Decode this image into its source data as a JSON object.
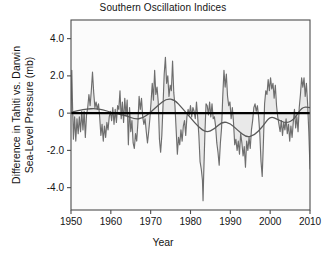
{
  "chart_data": {
    "type": "line",
    "title": "Southern Oscillation Indices",
    "xlabel": "Year",
    "ylabel": "Difference in Tahiti vs. Darwin Sea-Level Pressure (mb)",
    "ylabel_line1": "Difference in Tahiti vs. Darwin",
    "ylabel_line2": "Sea-Level Pressure (mb)",
    "xlim": [
      1950,
      2010
    ],
    "ylim": [
      -5.2,
      5.0
    ],
    "xticks": [
      1950,
      1960,
      1970,
      1980,
      1990,
      2000,
      2010
    ],
    "xtick_labels": [
      "1950",
      "1960",
      "1970",
      "1980",
      "1990",
      "2000",
      "2010"
    ],
    "yticks": [
      4,
      2,
      0,
      -2,
      -4
    ],
    "ytick_labels": [
      "4.0",
      "2.0",
      "0",
      "-2.0",
      "-4.0"
    ],
    "grid": false,
    "legend": "none",
    "reference_line": {
      "y": 0,
      "color": "#000000",
      "width": 2.2
    },
    "series": [
      {
        "name": "Southern Oscillation Index",
        "type": "line",
        "color": "#6e6e6e",
        "fill": "#e9e9e9",
        "x": [
          1950.0,
          1950.2,
          1950.4,
          1950.6,
          1950.9,
          1951.2,
          1951.5,
          1951.8,
          1952.1,
          1952.4,
          1952.7,
          1953.0,
          1953.3,
          1953.6,
          1953.9,
          1954.2,
          1954.5,
          1954.8,
          1955.1,
          1955.4,
          1955.7,
          1956.0,
          1956.3,
          1956.6,
          1956.9,
          1957.2,
          1957.5,
          1957.8,
          1958.1,
          1958.4,
          1958.7,
          1959.0,
          1959.3,
          1959.6,
          1959.9,
          1960.2,
          1960.5,
          1960.8,
          1961.1,
          1961.4,
          1961.7,
          1962.0,
          1962.3,
          1962.6,
          1962.9,
          1963.2,
          1963.5,
          1963.8,
          1964.1,
          1964.4,
          1964.7,
          1965.0,
          1965.3,
          1965.6,
          1965.9,
          1966.2,
          1966.5,
          1966.8,
          1967.1,
          1967.4,
          1967.7,
          1968.0,
          1968.3,
          1968.6,
          1968.9,
          1969.2,
          1969.5,
          1969.8,
          1970.1,
          1970.4,
          1970.7,
          1971.0,
          1971.3,
          1971.6,
          1971.9,
          1972.2,
          1972.5,
          1972.8,
          1973.1,
          1973.4,
          1973.7,
          1974.0,
          1974.3,
          1974.6,
          1974.9,
          1975.2,
          1975.5,
          1975.8,
          1976.1,
          1976.4,
          1976.7,
          1977.0,
          1977.3,
          1977.6,
          1977.9,
          1978.2,
          1978.5,
          1978.8,
          1979.1,
          1979.4,
          1979.7,
          1980.0,
          1980.3,
          1980.6,
          1980.9,
          1981.2,
          1981.5,
          1981.8,
          1982.1,
          1982.4,
          1982.7,
          1983.0,
          1983.15,
          1983.3,
          1983.6,
          1983.9,
          1984.2,
          1984.5,
          1984.8,
          1985.1,
          1985.4,
          1985.7,
          1986.0,
          1986.3,
          1986.6,
          1986.9,
          1987.2,
          1987.5,
          1987.8,
          1988.1,
          1988.4,
          1988.7,
          1989.0,
          1989.3,
          1989.6,
          1989.9,
          1990.2,
          1990.5,
          1990.8,
          1991.1,
          1991.4,
          1991.7,
          1992.0,
          1992.3,
          1992.6,
          1992.9,
          1993.2,
          1993.5,
          1993.8,
          1994.1,
          1994.4,
          1994.7,
          1995.0,
          1995.3,
          1995.6,
          1995.9,
          1996.2,
          1996.5,
          1996.8,
          1997.1,
          1997.4,
          1997.7,
          1998.0,
          1998.3,
          1998.6,
          1998.9,
          1999.2,
          1999.5,
          1999.8,
          2000.1,
          2000.4,
          2000.7,
          2001.0,
          2001.3,
          2001.6,
          2001.9,
          2002.2,
          2002.5,
          2002.8,
          2003.1,
          2003.4,
          2003.7,
          2004.0,
          2004.3,
          2004.6,
          2004.9,
          2005.2,
          2005.5,
          2005.8,
          2006.1,
          2006.4,
          2006.7,
          2007.0,
          2007.3,
          2007.6,
          2007.9,
          2008.2,
          2008.5,
          2008.8,
          2009.1,
          2009.4,
          2009.7,
          2010.0
        ],
        "y": [
          0.1,
          2.3,
          0.3,
          -1.4,
          -0.2,
          -1.5,
          -0.3,
          -1.1,
          -0.2,
          -1.0,
          0.1,
          -0.9,
          0.1,
          -1.3,
          -0.1,
          0.3,
          1.0,
          0.4,
          1.2,
          2.2,
          1.1,
          0.3,
          0.6,
          0.2,
          0.5,
          -0.2,
          -1.2,
          -0.6,
          -1.5,
          -0.7,
          -1.3,
          -0.5,
          -0.9,
          -0.2,
          0.1,
          -0.4,
          0.3,
          -0.6,
          0.2,
          -0.5,
          0.4,
          0.2,
          1.2,
          -0.3,
          0.6,
          -0.5,
          0.8,
          -0.1,
          0.7,
          -1.7,
          0.3,
          -1.0,
          -0.4,
          -1.6,
          -1.9,
          -1.1,
          -1.5,
          -0.5,
          0.9,
          0.2,
          0.8,
          -0.2,
          -0.6,
          -0.3,
          -1.0,
          -1.6,
          -1.0,
          -0.3,
          0.6,
          1.6,
          0.7,
          2.3,
          1.0,
          1.4,
          0.6,
          -1.4,
          -2.1,
          -1.2,
          0.4,
          2.1,
          3.0,
          1.6,
          2.0,
          0.9,
          1.5,
          1.2,
          2.8,
          1.1,
          0.4,
          -0.9,
          -2.2,
          -1.3,
          -1.7,
          -0.9,
          -1.5,
          -0.7,
          -0.4,
          -1.2,
          -0.2,
          0.2,
          -0.1,
          0.4,
          -0.2,
          0.3,
          0.1,
          -0.3,
          0.6,
          -0.2,
          -1.2,
          -2.6,
          -3.0,
          -3.6,
          -4.7,
          -3.4,
          -1.2,
          0.5,
          0.4,
          -0.1,
          0.6,
          -0.2,
          0.5,
          -0.3,
          -0.2,
          -0.7,
          -1.6,
          -2.1,
          -2.8,
          -1.6,
          -0.8,
          0.9,
          2.3,
          1.4,
          2.1,
          0.9,
          0.4,
          0.6,
          -0.3,
          0.3,
          -0.5,
          -1.7,
          -1.4,
          -2.0,
          -1.5,
          -2.2,
          -1.1,
          -1.6,
          -2.3,
          -1.8,
          -2.9,
          -1.5,
          -2.0,
          -1.3,
          -1.9,
          -0.9,
          -0.4,
          0.3,
          0.5,
          0.1,
          0.4,
          -0.2,
          -1.1,
          -2.6,
          -3.4,
          -1.6,
          0.5,
          1.2,
          1.0,
          1.8,
          1.2,
          1.9,
          1.3,
          1.6,
          0.8,
          1.5,
          0.4,
          -0.2,
          -0.6,
          -1.0,
          -0.4,
          -1.2,
          -0.5,
          -0.9,
          -0.3,
          -1.1,
          -0.6,
          -1.5,
          -0.7,
          -1.3,
          -0.5,
          0.2,
          -0.8,
          -0.2,
          -1.0,
          0.3,
          1.0,
          1.9,
          1.4,
          1.9,
          0.9,
          1.6,
          0.5,
          -1.0,
          -3.0
        ]
      },
      {
        "name": "Smoothed trend",
        "type": "line",
        "color": "#5a5a5a",
        "x": [
          1950,
          1952,
          1954,
          1956,
          1958,
          1960,
          1962,
          1964,
          1966,
          1968,
          1970,
          1972,
          1974,
          1976,
          1978,
          1980,
          1982,
          1984,
          1986,
          1988,
          1990,
          1992,
          1994,
          1996,
          1998,
          2000,
          2002,
          2004,
          2006,
          2008,
          2010
        ],
        "y": [
          0.05,
          0.15,
          0.22,
          0.25,
          0.18,
          0.05,
          -0.05,
          -0.15,
          -0.32,
          -0.28,
          0.05,
          0.45,
          0.78,
          0.72,
          0.25,
          -0.25,
          -0.75,
          -1.05,
          -0.85,
          -0.45,
          -0.55,
          -0.95,
          -1.3,
          -1.2,
          -0.75,
          -0.15,
          -0.35,
          -0.55,
          -0.35,
          0.35,
          0.3
        ]
      }
    ]
  },
  "caption": {
    "fragment": " "
  }
}
